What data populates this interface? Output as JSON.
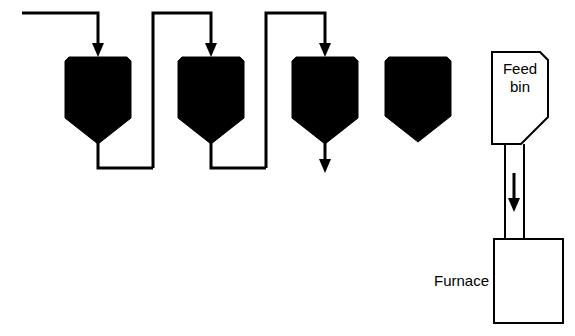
{
  "diagram": {
    "canvas": {
      "width": 575,
      "height": 336
    },
    "colors": {
      "background": "#ffffff",
      "line": "#000000",
      "hopper_fill": "#000000",
      "vessel_fill": "#ffffff"
    },
    "labels": {
      "feed_bin_line1": "Feed",
      "feed_bin_line2": "bin",
      "furnace": "Furnace"
    },
    "hoppers": [
      {
        "name": "hopper-1",
        "filled": true,
        "has_inlet_arrow": true,
        "has_outlet_pipe": true
      },
      {
        "name": "hopper-2",
        "filled": true,
        "has_inlet_arrow": true,
        "has_outlet_pipe": true
      },
      {
        "name": "hopper-3",
        "filled": true,
        "has_inlet_arrow": true,
        "has_outlet_arrow": true
      },
      {
        "name": "hopper-4",
        "filled": true,
        "has_inlet_arrow": false,
        "has_outlet_pipe": false
      }
    ],
    "flow_arrows": [
      {
        "name": "inlet-arrow-hopper-1",
        "direction": "down"
      },
      {
        "name": "inlet-arrow-hopper-2",
        "direction": "down"
      },
      {
        "name": "inlet-arrow-hopper-3",
        "direction": "down"
      },
      {
        "name": "outlet-arrow-hopper-3",
        "direction": "down"
      },
      {
        "name": "feed-bin-chute-arrow",
        "direction": "down"
      }
    ]
  }
}
